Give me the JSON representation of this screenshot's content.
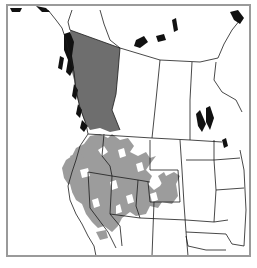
{
  "map": {
    "title": "Range map of western North America",
    "colors": {
      "background": "#ffffff",
      "frame": "#9a9a9a",
      "boundary": "#1a1a1a",
      "range_dark": "#6e6e6e",
      "range_light": "#9c9c9c",
      "water": "#111111"
    },
    "regions": [
      {
        "name": "British Columbia",
        "shading": "dark"
      },
      {
        "name": "Western United States",
        "shading": "light"
      }
    ]
  }
}
